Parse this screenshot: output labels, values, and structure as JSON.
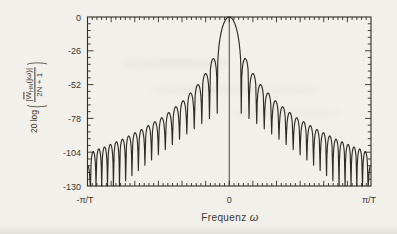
{
  "figure": {
    "xlabel": {
      "text": "Frequenz",
      "symbol": "ω"
    },
    "ylabel": {
      "prefix": "20 log",
      "open_paren": "(",
      "abs1": "|",
      "num_W": "W",
      "num_sub": "HN",
      "num_arg": "(jω)",
      "abs2": "|",
      "den": "2N + 1",
      "close_paren": ")"
    },
    "y_tick_labels": [
      "0",
      "-26",
      "-52",
      "-78",
      "-104",
      "-130"
    ],
    "x_tick_labels": [
      "-π/T",
      "0",
      "π/T"
    ],
    "ink_color": "#2f2c27",
    "paper_color": "#f2f0ea"
  },
  "chart_data": {
    "type": "line",
    "title": "",
    "xlabel": "Frequenz ω",
    "ylabel": "20 log(|W̄_HN(jω)| / (2N+1))",
    "x_range_labels": [
      "-π/T",
      "π/T"
    ],
    "ylim": [
      -130,
      0
    ],
    "y_major_ticks": [
      0,
      -26,
      -52,
      -78,
      -104,
      -130
    ],
    "y_minor_per_major": 5,
    "x_major_divisions": 12,
    "x_minor_per_major": 5,
    "grid": false,
    "legend": null,
    "curve": {
      "description": "Normalized log-magnitude spectrum of a Hann (Hanning) window: 0 dB main lobe at ω=0 with vertical reference line, symmetric decaying sidelobes separated by deep nulls, clipped half-lobe at ω=±π/T.",
      "symmetric": true,
      "center_reference_line": true,
      "main_lobe_peak_db": 0,
      "first_null_frac": 0.0847,
      "sidelobe_peaks_db": [
        -32,
        -43.5,
        -52,
        -58.5,
        -64.5,
        -69,
        -73.5,
        -77.5,
        -80.5,
        -83.5,
        -86.5,
        -89,
        -91.5,
        -94,
        -96,
        -98,
        -100,
        -101.5,
        -103.5
      ],
      "edge_lobe_peak_db": -114,
      "lobe_width_frac_start": 0.055,
      "lobe_width_frac_step": -0.00088,
      "null_depth_db_start": -74,
      "null_depth_db_step": -4.0,
      "floor_db": -130
    }
  }
}
